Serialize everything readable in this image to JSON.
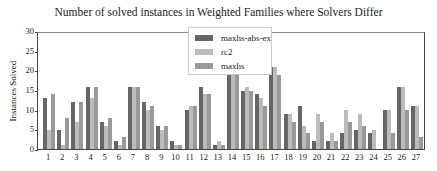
{
  "chart_data": {
    "type": "bar",
    "title": "Number of solved instances in Weighted Families where Solvers Differ",
    "xlabel": "",
    "ylabel": "Instances Solved",
    "ylim": [
      0,
      30
    ],
    "yticks": [
      0,
      5,
      10,
      15,
      20,
      25,
      30
    ],
    "grid": false,
    "legend_position": "upper center",
    "categories": [
      "1",
      "2",
      "3",
      "4",
      "5",
      "6",
      "7",
      "8",
      "9",
      "10",
      "11",
      "12",
      "13",
      "14",
      "15",
      "16",
      "17",
      "18",
      "19",
      "20",
      "21",
      "22",
      "23",
      "24",
      "25",
      "26",
      "27"
    ],
    "series": [
      {
        "name": "maxhs-abs-ex",
        "color": "#666666",
        "values": [
          13,
          5,
          12,
          16,
          7,
          2,
          16,
          12,
          6,
          2,
          10,
          16,
          1,
          19,
          15,
          14,
          21,
          9,
          11,
          2,
          2,
          4,
          5,
          4,
          10,
          16,
          11
        ]
      },
      {
        "name": "rc2",
        "color": "#bbbbbb",
        "values": [
          5,
          1,
          7,
          13,
          6,
          1,
          16,
          10,
          5,
          1,
          11,
          14,
          2,
          20,
          16,
          13,
          21,
          9,
          6,
          9,
          4,
          10,
          9,
          5,
          10,
          16,
          11
        ]
      },
      {
        "name": "maxhs",
        "color": "#999999",
        "values": [
          14,
          8,
          12,
          16,
          8,
          3,
          16,
          11,
          6,
          1,
          11,
          14,
          1,
          19,
          15,
          11,
          19,
          7,
          4,
          7,
          2,
          7,
          6,
          0,
          4,
          10,
          3
        ]
      }
    ]
  }
}
